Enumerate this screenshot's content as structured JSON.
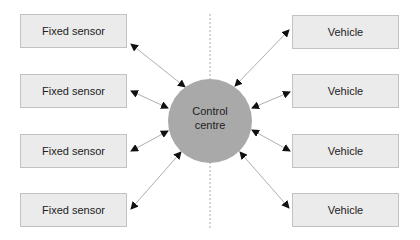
{
  "diagram": {
    "hub": {
      "line1": "Control",
      "line2": "centre",
      "fill": "#a9a9a9"
    },
    "left_nodes": [
      {
        "label": "Fixed sensor"
      },
      {
        "label": "Fixed sensor"
      },
      {
        "label": "Fixed sensor"
      },
      {
        "label": "Fixed sensor"
      }
    ],
    "right_nodes": [
      {
        "label": "Vehicle"
      },
      {
        "label": "Vehicle"
      },
      {
        "label": "Vehicle"
      },
      {
        "label": "Vehicle"
      }
    ],
    "connections": "bidirectional",
    "divider": "dashed vertical line through centre",
    "colors": {
      "box_fill": "#ebebeb",
      "box_border": "#c2c2c2",
      "arrow": "#888888",
      "hub_fill": "#a9a9a9"
    }
  }
}
